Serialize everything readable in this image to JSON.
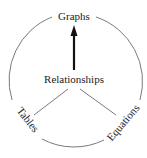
{
  "diagram": {
    "center_label": "Relationships",
    "nodes": [
      {
        "id": "graphs",
        "label": "Graphs",
        "position": "top"
      },
      {
        "id": "tables",
        "label": "Tables",
        "position": "bottom-left"
      },
      {
        "id": "equations",
        "label": "Equations",
        "position": "bottom-right"
      }
    ],
    "connections": [
      {
        "from": "Relationships",
        "to": "Graphs",
        "style": "thick-arrow"
      },
      {
        "from": "Relationships",
        "to": "Tables",
        "style": "thin-line"
      },
      {
        "from": "Relationships",
        "to": "Equations",
        "style": "thin-line"
      }
    ],
    "colors": {
      "circle": "#7a7a7a",
      "lines": "#7a7a7a",
      "arrow": "#111111",
      "text": "#222222",
      "background": "#ffffff"
    }
  }
}
